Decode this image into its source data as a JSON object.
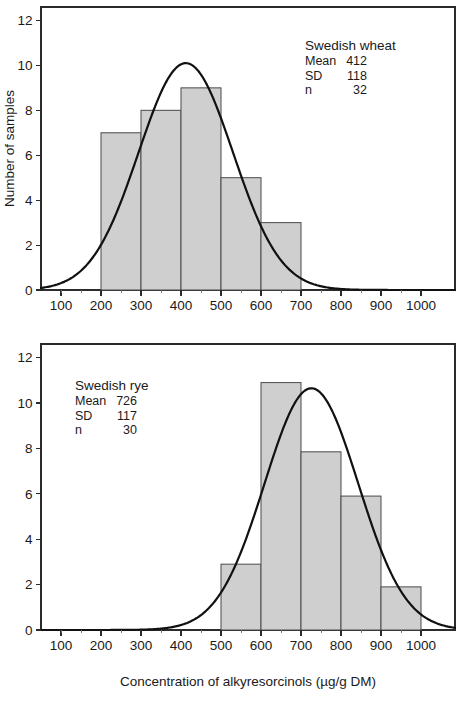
{
  "figure": {
    "width": 465,
    "height": 701,
    "background": "#ffffff",
    "ink_color": "#1a1a1a",
    "bar_fill": "#cfcfcf",
    "bar_stroke": "#4a4a4a",
    "curve_color": "#111111"
  },
  "xaxis_title": "Concentration of alkyresorcinols (µg/g DM)",
  "chart_data": [
    {
      "type": "bar",
      "panel": "top",
      "title": "",
      "xlabel": "",
      "ylabel": "Number of samples",
      "xlim": [
        50,
        1085
      ],
      "ylim": [
        0,
        12.6
      ],
      "grid": false,
      "xticks": [
        100,
        200,
        300,
        400,
        500,
        600,
        700,
        800,
        900,
        1000
      ],
      "xticklabels": [
        "100",
        "200",
        "300",
        "400",
        "500",
        "600",
        "700",
        "800",
        "900",
        "1000"
      ],
      "yticks": [
        0,
        2,
        4,
        6,
        8,
        10,
        12
      ],
      "yticklabels": [
        "0",
        "2",
        "4",
        "6",
        "8",
        "10",
        "12"
      ],
      "bin_edges": [
        200,
        300,
        400,
        500,
        600,
        700
      ],
      "categories": [
        "200-300",
        "300-400",
        "400-500",
        "500-600",
        "600-700"
      ],
      "values": [
        7,
        8,
        9,
        5,
        3
      ],
      "overlay": {
        "type": "normal-curve",
        "mean": 412,
        "sd": 118,
        "n": 32,
        "bin_width": 100,
        "peak_height": 10.1
      },
      "annotation": {
        "title": "Swedish wheat",
        "rows": [
          {
            "label": "Mean",
            "value": "412"
          },
          {
            "label": "SD",
            "value": "118"
          },
          {
            "label": "n",
            "value": "32"
          }
        ]
      },
      "legend_position": "upper-right"
    },
    {
      "type": "bar",
      "panel": "bottom",
      "title": "",
      "xlabel": "Concentration of alkyresorcinols (µg/g DM)",
      "ylabel": "",
      "xlim": [
        50,
        1085
      ],
      "ylim": [
        0,
        12.6
      ],
      "grid": false,
      "xticks": [
        100,
        200,
        300,
        400,
        500,
        600,
        700,
        800,
        900,
        1000
      ],
      "xticklabels": [
        "100",
        "200",
        "300",
        "400",
        "500",
        "600",
        "700",
        "800",
        "900",
        "1000"
      ],
      "yticks": [
        0,
        2,
        4,
        6,
        8,
        10,
        12
      ],
      "yticklabels": [
        "0",
        "2",
        "4",
        "6",
        "8",
        "10",
        "12"
      ],
      "bin_edges": [
        500,
        600,
        700,
        800,
        900,
        1000
      ],
      "categories": [
        "500-600",
        "600-700",
        "700-800",
        "800-900",
        "900-1000"
      ],
      "values": [
        2.9,
        10.9,
        7.85,
        5.9,
        1.9
      ],
      "overlay": {
        "type": "normal-curve",
        "mean": 726,
        "sd": 117,
        "n": 30,
        "bin_width": 100,
        "peak_height": 10.65
      },
      "annotation": {
        "title": "Swedish rye",
        "rows": [
          {
            "label": "Mean",
            "value": "726"
          },
          {
            "label": "SD",
            "value": "117"
          },
          {
            "label": "n",
            "value": "30"
          }
        ]
      },
      "legend_position": "upper-left"
    }
  ]
}
